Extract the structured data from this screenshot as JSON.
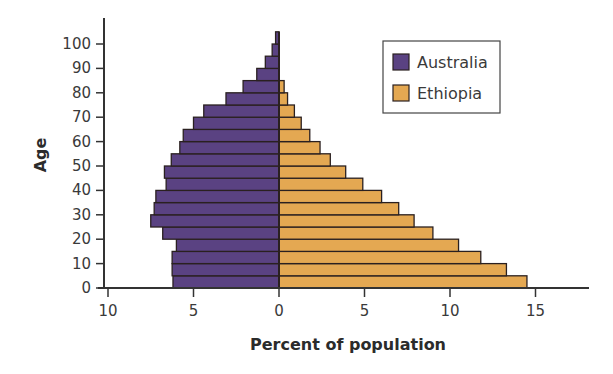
{
  "chart_data": {
    "type": "bar",
    "orientation": "horizontal",
    "subtype": "population-pyramid",
    "title": "",
    "xlabel": "Percent of population",
    "ylabel": "Age",
    "categories": [
      "0-4",
      "5-9",
      "10-14",
      "15-19",
      "20-24",
      "25-29",
      "30-34",
      "35-39",
      "40-44",
      "45-49",
      "50-54",
      "55-59",
      "60-64",
      "65-69",
      "70-74",
      "75-79",
      "80-84",
      "85-89",
      "90-94",
      "95-99",
      "100+"
    ],
    "series": [
      {
        "name": "Australia",
        "side": "left",
        "color": "#5a4282",
        "values": [
          6.2,
          6.25,
          6.25,
          6.0,
          6.8,
          7.5,
          7.3,
          7.2,
          6.6,
          6.7,
          6.3,
          5.8,
          5.6,
          5.0,
          4.4,
          3.1,
          2.1,
          1.3,
          0.8,
          0.4,
          0.2
        ]
      },
      {
        "name": "Ethiopia",
        "side": "right",
        "color": "#e4a852",
        "values": [
          14.5,
          13.3,
          11.8,
          10.5,
          9.0,
          7.9,
          7.0,
          6.0,
          4.9,
          3.9,
          3.0,
          2.4,
          1.8,
          1.3,
          0.9,
          0.5,
          0.3,
          0,
          0,
          0,
          0
        ]
      }
    ],
    "x_ticks": [
      {
        "value": -10,
        "label": "10"
      },
      {
        "value": -5,
        "label": "5"
      },
      {
        "value": 0,
        "label": "0"
      },
      {
        "value": 5,
        "label": "5"
      },
      {
        "value": 10,
        "label": "10"
      },
      {
        "value": 15,
        "label": "15"
      }
    ],
    "y_ticks": [
      0,
      10,
      20,
      30,
      40,
      50,
      60,
      70,
      80,
      90,
      100
    ],
    "xlim": [
      -10,
      18
    ],
    "ylim": [
      0,
      105
    ],
    "grid": false,
    "legend": {
      "position": "upper-right",
      "entries": [
        "Australia",
        "Ethiopia"
      ]
    }
  },
  "style": {
    "outline_color": "#2a2020",
    "axis_color": "#333333"
  }
}
